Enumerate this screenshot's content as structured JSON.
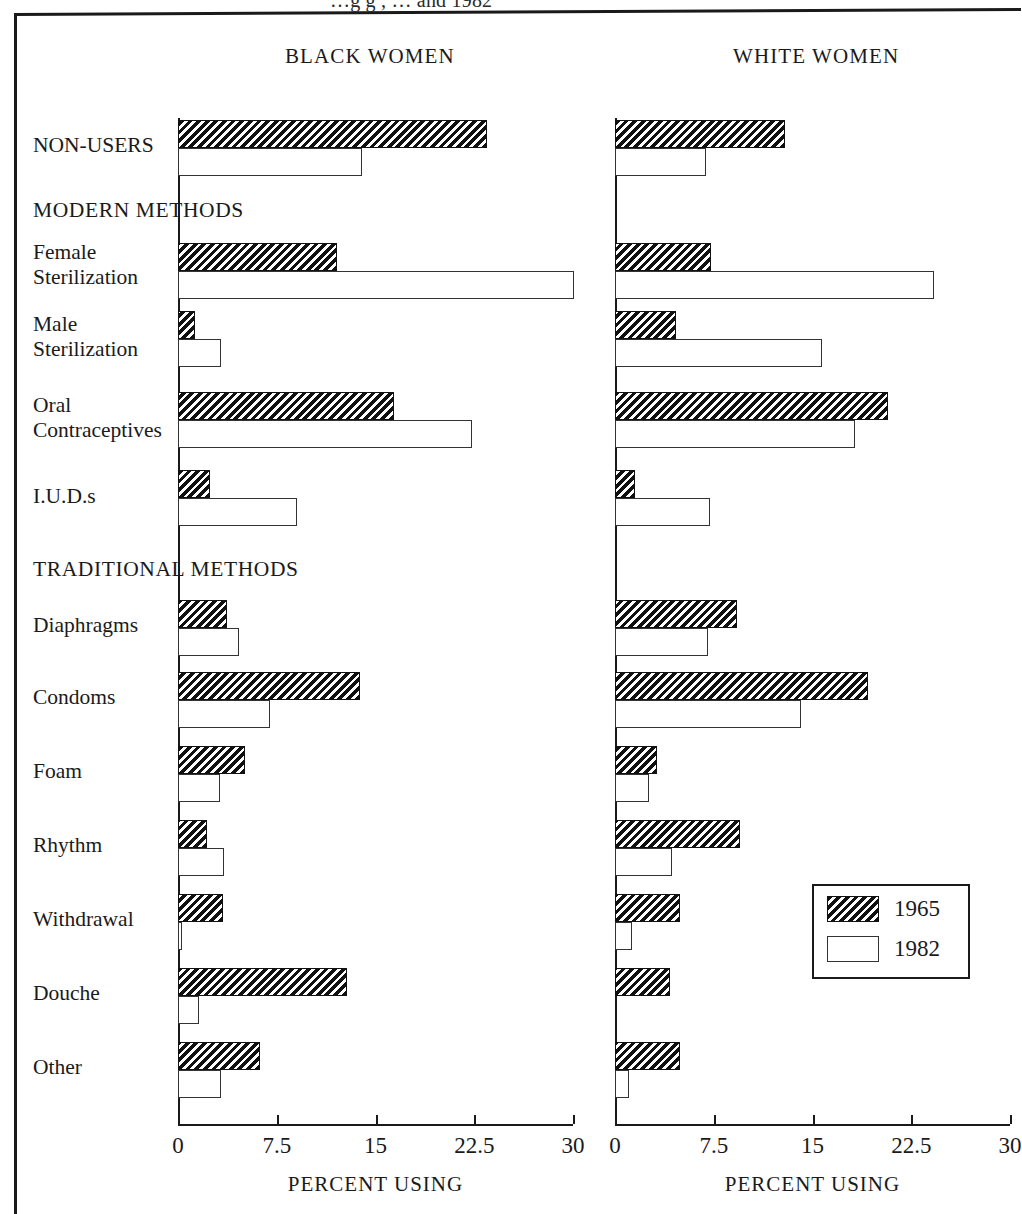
{
  "figure": {
    "clipped_title": "…g  g  ,  … and 1982",
    "panels": [
      {
        "key": "black",
        "title": "BLACK WOMEN"
      },
      {
        "key": "white",
        "title": "WHITE WOMEN"
      }
    ],
    "axis_caption": "PERCENT USING",
    "tick_labels": [
      "0",
      "7.5",
      "15",
      "22.5",
      "30"
    ]
  },
  "legend": {
    "items": [
      {
        "label": "1965",
        "pattern": "hatched"
      },
      {
        "label": "1982",
        "pattern": "open"
      }
    ]
  },
  "section_headings": {
    "modern": "MODERN METHODS",
    "traditional": "TRADITIONAL METHODS"
  },
  "row_labels": {
    "non_users": "NON-USERS",
    "female_sterilization": "Female\nSterilization",
    "male_sterilization": "Male\nSterilization",
    "oral_contraceptives": "Oral\nContraceptives",
    "iuds": "I.U.D.s",
    "diaphragms": "Diaphragms",
    "condoms": "Condoms",
    "foam": "Foam",
    "rhythm": "Rhythm",
    "withdrawal": "Withdrawal",
    "douche": "Douche",
    "other": "Other"
  },
  "colors": {
    "ink": "#1a1a1a",
    "bar_1965_fill": "#111111",
    "bar_1982_fill": "#ffffff"
  },
  "chart_data": {
    "type": "bar",
    "xlabel": "PERCENT USING",
    "ylabel": "",
    "xlim": [
      0,
      30
    ],
    "xticks": [
      0,
      7.5,
      15,
      22.5,
      30
    ],
    "grid": false,
    "orientation": "horizontal",
    "legend_position": "lower-right",
    "legend_entries": [
      "1965",
      "1982"
    ],
    "panels": [
      "BLACK WOMEN",
      "WHITE WOMEN"
    ],
    "categories": [
      "NON-USERS",
      "Female Sterilization",
      "Male Sterilization",
      "Oral Contraceptives",
      "I.U.D.s",
      "Diaphragms",
      "Condoms",
      "Foam",
      "Rhythm",
      "Withdrawal",
      "Douche",
      "Other"
    ],
    "category_groups": {
      "MODERN METHODS": [
        "Female Sterilization",
        "Male Sterilization",
        "Oral Contraceptives",
        "I.U.D.s"
      ],
      "TRADITIONAL METHODS": [
        "Diaphragms",
        "Condoms",
        "Foam",
        "Rhythm",
        "Withdrawal",
        "Douche",
        "Other"
      ]
    },
    "series": [
      {
        "panel": "BLACK WOMEN",
        "name": "1965",
        "values": [
          23.5,
          12.1,
          1.3,
          16.4,
          2.4,
          3.7,
          13.8,
          5.1,
          2.2,
          3.4,
          12.8,
          6.2
        ]
      },
      {
        "panel": "BLACK WOMEN",
        "name": "1982",
        "values": [
          14.0,
          30.1,
          3.3,
          22.3,
          9.0,
          4.6,
          7.0,
          3.2,
          3.5,
          0.3,
          1.6,
          3.3
        ]
      },
      {
        "panel": "WHITE WOMEN",
        "name": "1965",
        "values": [
          12.9,
          7.3,
          4.6,
          20.7,
          1.5,
          9.3,
          19.2,
          3.2,
          9.5,
          4.9,
          4.2,
          4.9
        ]
      },
      {
        "panel": "WHITE WOMEN",
        "name": "1982",
        "values": [
          6.9,
          24.2,
          15.7,
          18.2,
          7.2,
          7.1,
          14.1,
          2.6,
          4.3,
          1.3,
          0.0,
          1.1
        ]
      }
    ]
  },
  "layout": {
    "panels": [
      {
        "key": "black",
        "x0": 178,
        "x30": 573,
        "axis_top": 118,
        "axis_bottom": 1124
      },
      {
        "key": "white",
        "x0": 615,
        "x30": 1010,
        "axis_top": 118,
        "axis_bottom": 1124
      }
    ],
    "rows": [
      {
        "key": "non_users",
        "label_y": 133,
        "bar_y": 120,
        "label_lines": 1
      },
      {
        "key": "female_sterilization",
        "label_y": 240,
        "bar_y": 243,
        "label_lines": 2
      },
      {
        "key": "male_sterilization",
        "label_y": 312,
        "bar_y": 311,
        "label_lines": 2
      },
      {
        "key": "oral_contraceptives",
        "label_y": 393,
        "bar_y": 392,
        "label_lines": 2
      },
      {
        "key": "iuds",
        "label_y": 484,
        "bar_y": 470,
        "label_lines": 1
      },
      {
        "key": "diaphragms",
        "label_y": 613,
        "bar_y": 600,
        "label_lines": 1
      },
      {
        "key": "condoms",
        "label_y": 685,
        "bar_y": 672,
        "label_lines": 1
      },
      {
        "key": "foam",
        "label_y": 759,
        "bar_y": 746,
        "label_lines": 1
      },
      {
        "key": "rhythm",
        "label_y": 833,
        "bar_y": 820,
        "label_lines": 1
      },
      {
        "key": "withdrawal",
        "label_y": 907,
        "bar_y": 894,
        "label_lines": 1
      },
      {
        "key": "douche",
        "label_y": 981,
        "bar_y": 968,
        "label_lines": 1
      },
      {
        "key": "other",
        "label_y": 1055,
        "bar_y": 1042,
        "label_lines": 1
      }
    ],
    "section_headings": [
      {
        "key": "modern",
        "y": 198
      },
      {
        "key": "traditional",
        "y": 557
      }
    ],
    "bar_height": 28
  }
}
